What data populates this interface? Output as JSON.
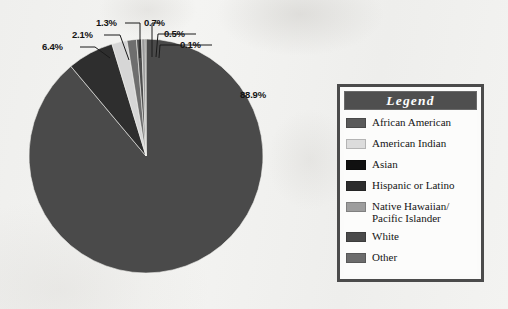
{
  "chart_data": {
    "type": "pie",
    "title": "",
    "legend_title": "Legend",
    "legend_position": "right",
    "categories": [
      "African American",
      "American Indian",
      "Asian",
      "Hispanic or Latino",
      "Native Hawaiian/\nPacific Islander",
      "White",
      "Other"
    ],
    "values": [
      6.4,
      2.1,
      0.1,
      1.3,
      0.5,
      88.9,
      0.7
    ],
    "value_labels": [
      "6.4%",
      "2.1%",
      "0.1%",
      "1.3%",
      "0.5%",
      "88.9%",
      "0.7%"
    ],
    "colors": [
      "#3a3a3a",
      "#d6d6d6",
      "#0d0d0d",
      "#2a2a2a",
      "#9a9a9a",
      "#4a4a4a",
      "#5c5c5c"
    ],
    "slices": [
      {
        "label": "White",
        "value": 88.9,
        "value_label": "88.9%",
        "color": "#4a4a4a"
      },
      {
        "label": "African American",
        "value": 6.4,
        "value_label": "6.4%",
        "color": "#2e2e2e"
      },
      {
        "label": "American Indian",
        "value": 2.1,
        "value_label": "2.1%",
        "color": "#d6d6d6"
      },
      {
        "label": "Hispanic or Latino",
        "value": 1.3,
        "value_label": "1.3%",
        "color": "#6e6e6e"
      },
      {
        "label": "Other",
        "value": 0.7,
        "value_label": "0.7%",
        "color": "#4f4f4f"
      },
      {
        "label": "Native Hawaiian/\nPacific Islander",
        "value": 0.5,
        "value_label": "0.5%",
        "color": "#9a9a9a"
      },
      {
        "label": "Asian",
        "value": 0.1,
        "value_label": "0.1%",
        "color": "#0d0d0d"
      }
    ],
    "units": "percent",
    "total": 100.0
  },
  "legend": {
    "title": "Legend",
    "items": [
      {
        "label": "African American",
        "color": "#5a5a5a"
      },
      {
        "label": "American Indian",
        "color": "#dcdcdc"
      },
      {
        "label": "Asian",
        "color": "#101010"
      },
      {
        "label": "Hispanic or Latino",
        "color": "#2c2c2c"
      },
      {
        "label": "Native Hawaiian/\nPacific Islander",
        "color": "#9d9d9d"
      },
      {
        "label": "White",
        "color": "#4a4a4a"
      },
      {
        "label": "Other",
        "color": "#6c6c6c"
      }
    ]
  },
  "pct_labels": [
    {
      "text": "6.4%",
      "x": 42,
      "y": 41
    },
    {
      "text": "2.1%",
      "x": 72,
      "y": 29
    },
    {
      "text": "1.3%",
      "x": 96,
      "y": 17
    },
    {
      "text": "0.7%",
      "x": 144,
      "y": 17
    },
    {
      "text": "0.5%",
      "x": 164,
      "y": 28
    },
    {
      "text": "0.1%",
      "x": 180,
      "y": 39
    },
    {
      "text": "88.9%",
      "x": 240,
      "y": 89
    }
  ]
}
